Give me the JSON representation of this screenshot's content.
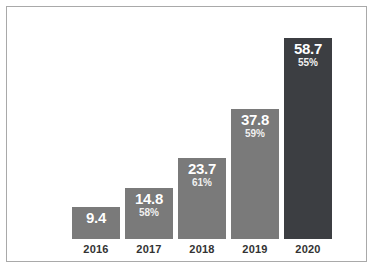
{
  "chart_data": {
    "type": "bar",
    "title": "",
    "subtitle": "",
    "xlabel": "",
    "ylabel": "",
    "categories": [
      "2016",
      "2017",
      "2018",
      "2019",
      "2020"
    ],
    "values": [
      9.4,
      14.8,
      23.7,
      37.8,
      58.7
    ],
    "value_labels": [
      "9.4",
      "14.8",
      "23.7",
      "37.8",
      "58.7"
    ],
    "secondary_labels": [
      "",
      "58%",
      "61%",
      "59%",
      "55%"
    ],
    "series": [
      {
        "name": "value",
        "values": [
          9.4,
          14.8,
          23.7,
          37.8,
          58.7
        ]
      },
      {
        "name": "percent",
        "values": [
          null,
          58,
          61,
          59,
          55
        ]
      }
    ],
    "bar_colors": [
      "#7a7a7a",
      "#7a7a7a",
      "#7a7a7a",
      "#7a7a7a",
      "#3c3e42"
    ],
    "ylim": [
      0,
      59.5
    ],
    "grid": false,
    "legend": false,
    "legend_position": "none",
    "axis_line": false,
    "frame_color": "#a9a9a9",
    "background_color": "#ffffff",
    "value_label_color": "#ffffff",
    "tick_label_color": "#333333"
  }
}
